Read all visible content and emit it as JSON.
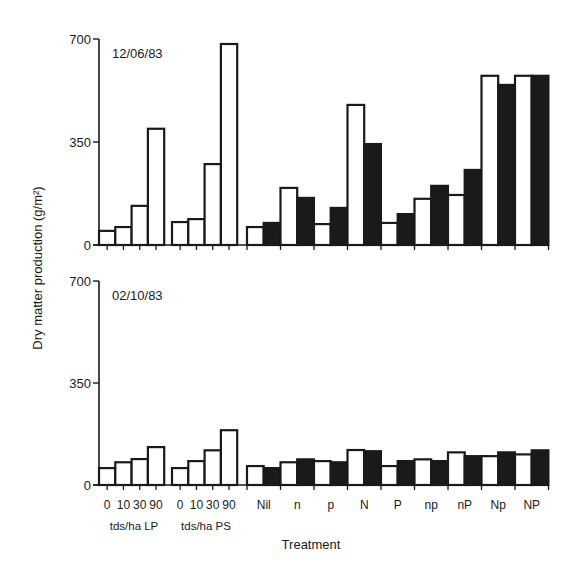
{
  "chart_data": [
    {
      "type": "bar",
      "panel": "top",
      "title": "12/06/83",
      "ylabel": "Dry matter production (g/m²)",
      "xlabel": "Treatment",
      "ylim": [
        0,
        700
      ],
      "yticks": [
        0,
        350,
        700
      ],
      "grid": false,
      "groups": [
        {
          "label": "tds/ha LP",
          "categories": [
            "0",
            "10",
            "30",
            "90"
          ],
          "values": [
            48,
            61,
            133,
            395
          ]
        },
        {
          "label": "tds/ha PS",
          "categories": [
            "0",
            "10",
            "30",
            "90"
          ],
          "values": [
            78,
            88,
            275,
            683
          ]
        }
      ],
      "paired_categories": [
        "Nil",
        "n",
        "p",
        "N",
        "P",
        "np",
        "nP",
        "Np",
        "NP"
      ],
      "series": [
        {
          "name": "open",
          "fill": "#ffffff",
          "values": [
            61,
            194,
            71,
            476,
            75,
            157,
            170,
            575,
            575
          ]
        },
        {
          "name": "filled",
          "fill": "#1a1a1a",
          "values": [
            75,
            160,
            126,
            343,
            105,
            201,
            255,
            544,
            575
          ]
        }
      ]
    },
    {
      "type": "bar",
      "panel": "bottom",
      "title": "02/10/83",
      "ylabel": "Dry matter production (g/m²)",
      "xlabel": "Treatment",
      "ylim": [
        0,
        700
      ],
      "yticks": [
        0,
        350,
        700
      ],
      "grid": false,
      "groups": [
        {
          "label": "tds/ha LP",
          "categories": [
            "0",
            "10",
            "30",
            "90"
          ],
          "values": [
            58,
            78,
            89,
            130
          ]
        },
        {
          "label": "tds/ha PS",
          "categories": [
            "0",
            "10",
            "30",
            "90"
          ],
          "values": [
            58,
            82,
            119,
            188
          ]
        }
      ],
      "paired_categories": [
        "Nil",
        "n",
        "p",
        "N",
        "P",
        "np",
        "nP",
        "Np",
        "NP"
      ],
      "series": [
        {
          "name": "open",
          "fill": "#ffffff",
          "values": [
            65,
            78,
            82,
            120,
            65,
            88,
            112,
            99,
            105
          ]
        },
        {
          "name": "filled",
          "fill": "#1a1a1a",
          "values": [
            58,
            88,
            78,
            116,
            82,
            82,
            99,
            112,
            119
          ]
        }
      ]
    }
  ],
  "labels": {
    "ylabel": "Dry matter production (g/m²)",
    "xlabel": "Treatment",
    "top_date": "12/06/83",
    "bottom_date": "02/10/83",
    "ytick_0": "0",
    "ytick_350": "350",
    "ytick_700": "700",
    "rate_ticks": [
      "0",
      "10",
      "30",
      "90"
    ],
    "group_lp": "tds/ha LP",
    "group_ps": "tds/ha PS",
    "treatments": [
      "Nil",
      "n",
      "p",
      "N",
      "P",
      "np",
      "nP",
      "Np",
      "NP"
    ]
  }
}
